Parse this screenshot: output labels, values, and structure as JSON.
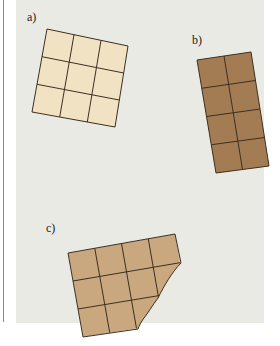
{
  "figure": {
    "labels": {
      "a": "a)",
      "b": "b)",
      "c": "c)"
    },
    "colors": {
      "background": "#e9eae4",
      "light_fill": "#f1e2c4",
      "dark_fill": "#a47c54",
      "medium_fill": "#c9a77f",
      "grid_line": "#3c2f22"
    },
    "shapes": [
      {
        "id": "a",
        "description": "3x3 grid of light squares",
        "rows": 3,
        "cols": 3
      },
      {
        "id": "b",
        "description": "4x2 grid of dark squares",
        "rows": 4,
        "cols": 2
      },
      {
        "id": "c",
        "description": "3x4 grid of medium squares with a bitten corner",
        "rows": 3,
        "cols": 4
      }
    ]
  }
}
